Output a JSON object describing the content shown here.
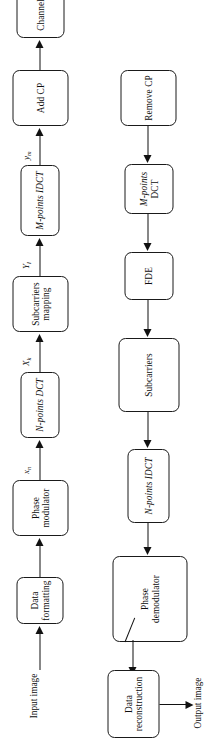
{
  "diagram": {
    "orientation": "rotated-90",
    "ink_color": "#111111",
    "background": "#ffffff",
    "transmitter_chain": {
      "input_label_line1": "Input",
      "input_label_line2": "image",
      "blocks": [
        {
          "id": "data-formatting",
          "line1": "Data",
          "line2": "formatting"
        },
        {
          "id": "phase-modulator",
          "line1": "Phase",
          "line2": "modulator"
        },
        {
          "id": "n-points-dct",
          "line1": "N-points DCT",
          "line2": ""
        },
        {
          "id": "subcarriers-mapping",
          "line1": "Subcarriers",
          "line2": "mapping"
        },
        {
          "id": "m-points-idct",
          "line1": "M-points IDCT",
          "line2": ""
        },
        {
          "id": "add-cp",
          "line1": "Add CP",
          "line2": ""
        }
      ],
      "signals": [
        {
          "id": "x-n",
          "base": "x",
          "sub": "n"
        },
        {
          "id": "X-k",
          "base": "X",
          "sub": "k"
        },
        {
          "id": "Y-l",
          "base": "Y",
          "sub": "l"
        },
        {
          "id": "y-m",
          "base": "y",
          "sub": "m"
        }
      ]
    },
    "channel": {
      "id": "channel",
      "line1": "Channel",
      "line2": ""
    },
    "receiver_chain": {
      "output_label_line1": "Output",
      "output_label_line2": "image",
      "blocks": [
        {
          "id": "remove-cp",
          "line1": "Remove CP",
          "line2": ""
        },
        {
          "id": "m-points-dct",
          "line1": "M-points",
          "line2": "DCT"
        },
        {
          "id": "fde",
          "line1": "FDE",
          "line2": ""
        },
        {
          "id": "subcarriers",
          "line1": "Subcarriers",
          "line2": ""
        },
        {
          "id": "n-points-idct",
          "line1": "N-points IDCT",
          "line2": ""
        },
        {
          "id": "phase-demodulator",
          "line1": "Phase",
          "line2": "demodulator"
        },
        {
          "id": "data-reconstruction",
          "line1": "Data",
          "line2": "reconstruction"
        }
      ]
    }
  }
}
